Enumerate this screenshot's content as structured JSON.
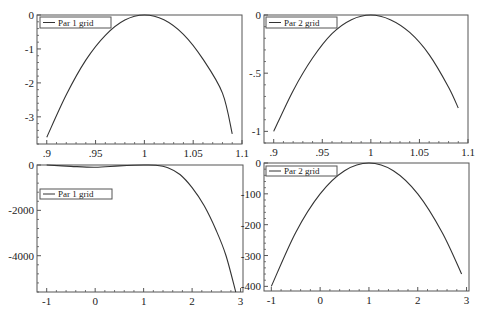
{
  "chart_data": [
    {
      "type": "line",
      "title": "",
      "xlabel": "",
      "ylabel": "",
      "xlim": [
        0.89,
        1.1
      ],
      "ylim": [
        -3.8,
        0
      ],
      "xticks": [
        0.9,
        0.95,
        1,
        1.05,
        1.1
      ],
      "xtick_labels": [
        ".9",
        ".95",
        "1",
        "1.05",
        "1.1"
      ],
      "yticks": [
        0,
        -1,
        -2,
        -3
      ],
      "ytick_labels": [
        "0",
        "-1",
        "-2",
        "-3"
      ],
      "grid": false,
      "legend": {
        "position": "upper left",
        "entries": [
          "Par 1 grid"
        ]
      },
      "series": [
        {
          "name": "Par 1 grid",
          "x": [
            0.9,
            0.92,
            0.94,
            0.96,
            0.98,
            1.0,
            1.02,
            1.04,
            1.06,
            1.08,
            1.09
          ],
          "y": [
            -3.6,
            -2.35,
            -1.33,
            -0.6,
            -0.15,
            0,
            -0.14,
            -0.57,
            -1.3,
            -2.3,
            -3.5
          ]
        }
      ]
    },
    {
      "type": "line",
      "title": "",
      "xlabel": "",
      "ylabel": "",
      "xlim": [
        0.89,
        1.1
      ],
      "ylim": [
        -1.1,
        0
      ],
      "xticks": [
        0.9,
        0.95,
        1,
        1.05,
        1.1
      ],
      "xtick_labels": [
        ".9",
        ".95",
        "1",
        "1.05",
        "1.1"
      ],
      "yticks": [
        0,
        -0.5,
        -1
      ],
      "ytick_labels": [
        "0",
        "-.5",
        "-1"
      ],
      "grid": false,
      "legend": {
        "position": "upper left",
        "entries": [
          "Par 2 grid"
        ]
      },
      "series": [
        {
          "name": "Par 2 grid",
          "x": [
            0.9,
            0.92,
            0.94,
            0.96,
            0.98,
            1.0,
            1.02,
            1.04,
            1.06,
            1.08,
            1.09
          ],
          "y": [
            -1.0,
            -0.65,
            -0.37,
            -0.16,
            -0.04,
            0,
            -0.04,
            -0.15,
            -0.34,
            -0.62,
            -0.8
          ]
        }
      ]
    },
    {
      "type": "line",
      "title": "",
      "xlabel": "",
      "ylabel": "",
      "xlim": [
        -1.2,
        3.05
      ],
      "ylim": [
        -5600,
        0
      ],
      "xticks": [
        -1,
        0,
        1,
        2,
        3
      ],
      "xtick_labels": [
        "-1",
        "0",
        "1",
        "2",
        "3"
      ],
      "yticks": [
        0,
        -2000,
        -4000
      ],
      "ytick_labels": [
        "0",
        "-2000",
        "-4000"
      ],
      "grid": false,
      "legend": {
        "position": "upper left",
        "entries": [
          "Par 1 grid"
        ]
      },
      "series": [
        {
          "name": "Par 1 grid",
          "x": [
            -1,
            -0.5,
            0,
            0.5,
            1,
            1.25,
            1.5,
            1.75,
            2,
            2.25,
            2.5,
            2.7,
            2.9
          ],
          "y": [
            0,
            -60,
            -100,
            -40,
            0,
            -10,
            -120,
            -420,
            -1000,
            -1800,
            -2900,
            -4000,
            -5600
          ]
        }
      ]
    },
    {
      "type": "line",
      "title": "",
      "xlabel": "",
      "ylabel": "",
      "xlim": [
        -1.15,
        3.05
      ],
      "ylim": [
        -415,
        0
      ],
      "xticks": [
        -1,
        0,
        1,
        2,
        3
      ],
      "xtick_labels": [
        "-1",
        "0",
        "1",
        "2",
        "3"
      ],
      "yticks": [
        0,
        -100,
        -200,
        -300,
        -400
      ],
      "ytick_labels": [
        "0",
        "-100",
        "-200",
        "-300",
        "-400"
      ],
      "grid": false,
      "legend": {
        "position": "upper left",
        "entries": [
          "Par 2 grid"
        ]
      },
      "series": [
        {
          "name": "Par 2 grid",
          "x": [
            -1,
            -0.5,
            0,
            0.5,
            1,
            1.5,
            2,
            2.5,
            2.9
          ],
          "y": [
            -400,
            -225,
            -100,
            -25,
            0,
            -25,
            -100,
            -225,
            -360
          ]
        }
      ]
    }
  ],
  "panels": [
    {
      "legend": "Par 1 grid"
    },
    {
      "legend": "Par 2 grid"
    },
    {
      "legend": "Par 1 grid"
    },
    {
      "legend": "Par 2 grid"
    }
  ]
}
